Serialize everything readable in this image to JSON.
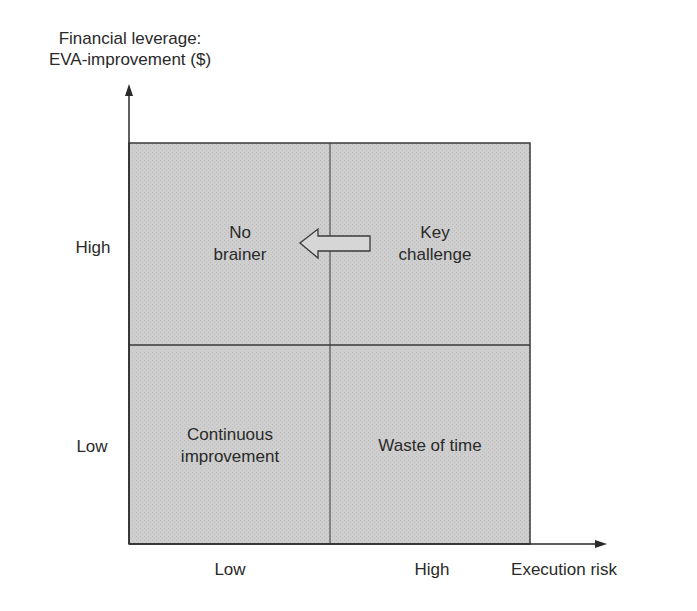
{
  "diagram": {
    "type": "2x2 matrix",
    "y_axis": {
      "title_line1": "Financial leverage:",
      "title_line2": "EVA-improvement ($)",
      "ticks": [
        "High",
        "Low"
      ]
    },
    "x_axis": {
      "title": "Execution risk",
      "ticks": [
        "Low",
        "High"
      ]
    },
    "quadrants": {
      "top_left": {
        "line1": "No",
        "line2": "brainer"
      },
      "top_right": {
        "line1": "Key",
        "line2": "challenge"
      },
      "bottom_left": {
        "line1": "Continuous",
        "line2": "improvement"
      },
      "bottom_right": {
        "line1": "Waste of time"
      }
    },
    "arrow": {
      "from": "Key challenge",
      "to": "No brainer",
      "style": "hollow block arrow pointing left"
    },
    "colors": {
      "fill": "#cdcdcd",
      "line": "#3a3a3a",
      "text": "#2a2a2a",
      "background": "#ffffff"
    }
  }
}
